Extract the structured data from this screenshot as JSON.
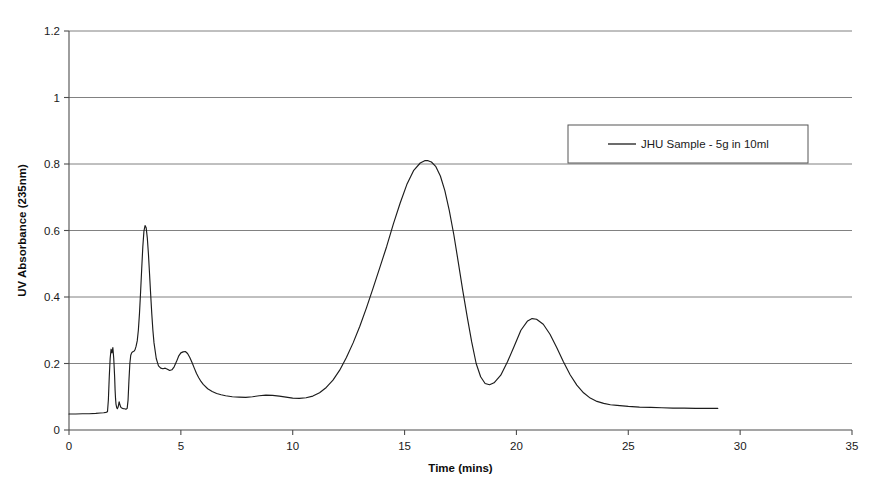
{
  "chart_data": {
    "type": "line",
    "title": "",
    "xlabel": "Time (mins)",
    "ylabel": "UV Absorbance (235nm)",
    "xlim": [
      0,
      35
    ],
    "ylim": [
      0,
      1.2
    ],
    "xticks": [
      "0",
      "5",
      "10",
      "15",
      "20",
      "25",
      "30",
      "35"
    ],
    "xtick_values": [
      0,
      5,
      10,
      15,
      20,
      25,
      30,
      35
    ],
    "yticks": [
      "0",
      "0.2",
      "0.4",
      "0.6",
      "0.8",
      "1",
      "1.2"
    ],
    "ytick_values": [
      0,
      0.2,
      0.4,
      0.6,
      0.8,
      1,
      1.2
    ],
    "grid": "horizontal",
    "legend_position": "upper-right-inside",
    "series": [
      {
        "name": "JHU Sample - 5g in 10ml",
        "color": "#1c1c1c",
        "x": [
          0.0,
          0.3,
          0.6,
          0.9,
          1.2,
          1.4,
          1.55,
          1.65,
          1.72,
          1.76,
          1.8,
          1.84,
          1.88,
          1.92,
          1.96,
          2.0,
          2.04,
          2.06,
          2.08,
          2.1,
          2.13,
          2.16,
          2.2,
          2.24,
          2.28,
          2.32,
          2.36,
          2.4,
          2.44,
          2.48,
          2.52,
          2.56,
          2.6,
          2.64,
          2.68,
          2.72,
          2.76,
          2.8,
          2.84,
          2.88,
          2.92,
          2.96,
          3.0,
          3.05,
          3.1,
          3.15,
          3.2,
          3.25,
          3.3,
          3.35,
          3.4,
          3.45,
          3.5,
          3.55,
          3.6,
          3.65,
          3.7,
          3.75,
          3.8,
          3.9,
          4.0,
          4.1,
          4.2,
          4.3,
          4.4,
          4.5,
          4.6,
          4.7,
          4.8,
          4.9,
          5.0,
          5.1,
          5.2,
          5.3,
          5.4,
          5.5,
          5.6,
          5.7,
          5.8,
          5.9,
          6.0,
          6.2,
          6.4,
          6.6,
          6.8,
          7.0,
          7.3,
          7.6,
          7.9,
          8.2,
          8.5,
          8.8,
          9.1,
          9.4,
          9.7,
          10.0,
          10.3,
          10.6,
          10.9,
          11.2,
          11.5,
          11.8,
          12.1,
          12.4,
          12.7,
          13.0,
          13.3,
          13.6,
          13.9,
          14.2,
          14.5,
          14.8,
          15.1,
          15.4,
          15.7,
          15.9,
          16.05,
          16.2,
          16.4,
          16.6,
          16.8,
          17.0,
          17.2,
          17.4,
          17.6,
          17.8,
          18.0,
          18.2,
          18.4,
          18.6,
          18.8,
          19.0,
          19.3,
          19.6,
          19.9,
          20.2,
          20.5,
          20.7,
          20.9,
          21.2,
          21.5,
          21.8,
          22.1,
          22.4,
          22.7,
          23.0,
          23.3,
          23.6,
          23.9,
          24.2,
          24.5,
          25.0,
          25.5,
          26.0,
          26.5,
          27.0,
          27.5,
          28.0,
          28.5,
          29.0
        ],
        "y": [
          0.048,
          0.048,
          0.049,
          0.049,
          0.05,
          0.051,
          0.052,
          0.053,
          0.055,
          0.09,
          0.16,
          0.215,
          0.243,
          0.232,
          0.248,
          0.215,
          0.16,
          0.12,
          0.095,
          0.078,
          0.068,
          0.064,
          0.07,
          0.085,
          0.075,
          0.068,
          0.066,
          0.065,
          0.064,
          0.064,
          0.063,
          0.063,
          0.065,
          0.09,
          0.15,
          0.2,
          0.225,
          0.232,
          0.235,
          0.236,
          0.238,
          0.243,
          0.252,
          0.268,
          0.3,
          0.35,
          0.415,
          0.485,
          0.552,
          0.598,
          0.615,
          0.608,
          0.578,
          0.53,
          0.47,
          0.408,
          0.35,
          0.3,
          0.262,
          0.215,
          0.193,
          0.186,
          0.184,
          0.186,
          0.183,
          0.179,
          0.181,
          0.19,
          0.205,
          0.222,
          0.232,
          0.235,
          0.236,
          0.23,
          0.218,
          0.203,
          0.186,
          0.17,
          0.157,
          0.146,
          0.137,
          0.124,
          0.116,
          0.11,
          0.106,
          0.103,
          0.1,
          0.099,
          0.098,
          0.1,
          0.103,
          0.105,
          0.104,
          0.102,
          0.099,
          0.096,
          0.095,
          0.097,
          0.102,
          0.112,
          0.128,
          0.15,
          0.18,
          0.218,
          0.262,
          0.312,
          0.368,
          0.428,
          0.49,
          0.552,
          0.62,
          0.682,
          0.738,
          0.78,
          0.803,
          0.81,
          0.81,
          0.806,
          0.792,
          0.764,
          0.72,
          0.66,
          0.588,
          0.505,
          0.42,
          0.34,
          0.265,
          0.2,
          0.16,
          0.14,
          0.136,
          0.142,
          0.165,
          0.205,
          0.252,
          0.3,
          0.328,
          0.335,
          0.333,
          0.318,
          0.288,
          0.248,
          0.205,
          0.166,
          0.135,
          0.112,
          0.096,
          0.086,
          0.08,
          0.076,
          0.074,
          0.071,
          0.069,
          0.068,
          0.067,
          0.066,
          0.066,
          0.065,
          0.065,
          0.065
        ]
      }
    ]
  },
  "legend": {
    "entries": [
      {
        "label": "JHU Sample - 5g in 10ml"
      }
    ]
  }
}
